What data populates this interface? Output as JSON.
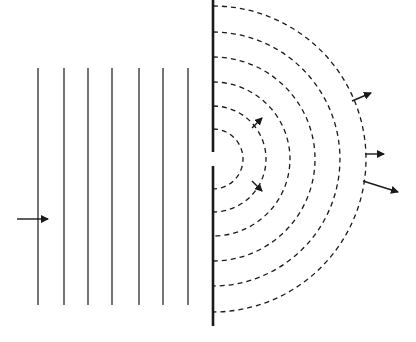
{
  "diagram": {
    "colors": {
      "background": "#ffffff",
      "ink": "#1a1a1a",
      "wave": "#3a3a3a"
    },
    "plane_waves": {
      "x_positions": [
        38,
        64,
        88,
        112,
        139,
        163,
        188
      ],
      "y_top": 68,
      "y_bottom": 305
    },
    "incident_arrow": {
      "x1": 17,
      "y1": 219,
      "x2": 48,
      "y2": 219
    },
    "barrier": {
      "x": 213,
      "y_top": 0,
      "gap_top": 152,
      "gap_bottom": 166,
      "y_bottom": 326
    },
    "slit_center": {
      "x": 213,
      "y": 159
    },
    "circular_waves": {
      "radii": [
        30,
        53,
        77,
        102,
        127,
        153
      ]
    },
    "outgoing_arrows": [
      {
        "x1": 252,
        "y1": 128,
        "x2": 262,
        "y2": 118
      },
      {
        "x1": 252,
        "y1": 181,
        "x2": 262,
        "y2": 191
      },
      {
        "x1": 352,
        "y1": 101,
        "x2": 371,
        "y2": 93
      },
      {
        "x1": 365,
        "y1": 154,
        "x2": 384,
        "y2": 154
      },
      {
        "x1": 363,
        "y1": 181,
        "x2": 398,
        "y2": 192
      }
    ]
  }
}
